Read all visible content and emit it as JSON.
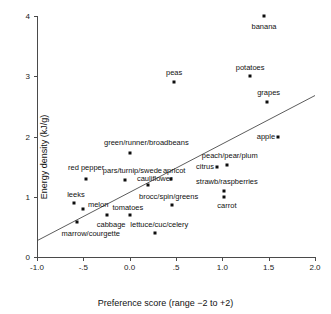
{
  "chart_data": {
    "type": "scatter",
    "title": "",
    "xlabel": "Preference score (range −2 to +2)",
    "ylabel": "Energy density (kJ/g)",
    "xlim": [
      -1.0,
      2.0
    ],
    "ylim": [
      0,
      4
    ],
    "xticks": [
      "-1.0",
      "-.5",
      "0.0",
      ".5",
      "1.0",
      "1.5",
      "2.0"
    ],
    "xtick_values": [
      -1.0,
      -0.5,
      0.0,
      0.5,
      1.0,
      1.5,
      2.0
    ],
    "yticks": [
      "0",
      "1",
      "2",
      "3",
      "4"
    ],
    "ytick_values": [
      0,
      1,
      2,
      3,
      4
    ],
    "grid": false,
    "legend": "none",
    "trendline": {
      "x0": -1.0,
      "y0": 0.27,
      "x1": 2.0,
      "y1": 2.68
    },
    "points": [
      {
        "label": "banana",
        "x": 1.45,
        "y": 4.0,
        "label_pos": "below",
        "lx": 1.45,
        "ly": 3.82
      },
      {
        "label": "peas",
        "x": 0.48,
        "y": 2.9,
        "label_pos": "above",
        "lx": 0.48,
        "ly": 3.06
      },
      {
        "label": "potatoes",
        "x": 1.3,
        "y": 3.0,
        "label_pos": "above",
        "lx": 1.3,
        "ly": 3.14
      },
      {
        "label": "grapes",
        "x": 1.48,
        "y": 2.58,
        "label_pos": "above",
        "lx": 1.5,
        "ly": 2.72
      },
      {
        "label": "apple",
        "x": 1.6,
        "y": 2.0,
        "label_pos": "left",
        "lx": 1.57,
        "ly": 2.0
      },
      {
        "label": "green/runner/broadbeans",
        "x": 0.0,
        "y": 1.73,
        "label_pos": "above",
        "lx": 0.18,
        "ly": 1.9
      },
      {
        "label": "peach/pear/plum",
        "x": 1.05,
        "y": 1.52,
        "label_pos": "above",
        "lx": 1.08,
        "ly": 1.68
      },
      {
        "label": "citrus",
        "x": 0.94,
        "y": 1.49,
        "label_pos": "left",
        "lx": 0.91,
        "ly": 1.49
      },
      {
        "label": "red pepper",
        "x": -0.47,
        "y": 1.3,
        "label_pos": "above",
        "lx": -0.47,
        "ly": 1.48
      },
      {
        "label": "pars/turnip/swede",
        "x": -0.05,
        "y": 1.27,
        "label_pos": "above",
        "lx": 0.03,
        "ly": 1.42
      },
      {
        "label": "apricot",
        "x": 0.45,
        "y": 1.3,
        "label_pos": "above",
        "lx": 0.48,
        "ly": 1.42
      },
      {
        "label": "cauliflower",
        "x": 0.2,
        "y": 1.2,
        "label_pos": "above",
        "lx": 0.27,
        "ly": 1.3
      },
      {
        "label": "strawb/raspberries",
        "x": 1.02,
        "y": 1.1,
        "label_pos": "above",
        "lx": 1.05,
        "ly": 1.24
      },
      {
        "label": "carrot",
        "x": 1.02,
        "y": 1.0,
        "label_pos": "below",
        "lx": 1.05,
        "ly": 0.84
      },
      {
        "label": "leeks",
        "x": -0.6,
        "y": 0.9,
        "label_pos": "above",
        "lx": -0.58,
        "ly": 1.03
      },
      {
        "label": "brocc/spin/greens",
        "x": 0.46,
        "y": 0.87,
        "label_pos": "above",
        "lx": 0.42,
        "ly": 1.0
      },
      {
        "label": "melon",
        "x": -0.5,
        "y": 0.8,
        "label_pos": "right",
        "lx": -0.45,
        "ly": 0.86
      },
      {
        "label": "tomatoes",
        "x": 0.0,
        "y": 0.69,
        "label_pos": "above",
        "lx": -0.02,
        "ly": 0.82
      },
      {
        "label": "cabbage",
        "x": -0.25,
        "y": 0.69,
        "label_pos": "below",
        "lx": -0.2,
        "ly": 0.53
      },
      {
        "label": "marrow/courgette",
        "x": -0.57,
        "y": 0.58,
        "label_pos": "below",
        "lx": -0.42,
        "ly": 0.38
      },
      {
        "label": "lettuce/cuc/celery",
        "x": 0.27,
        "y": 0.4,
        "label_pos": "above",
        "lx": 0.32,
        "ly": 0.53
      }
    ]
  },
  "style": {
    "marker_color": "#0d0d0d",
    "axis_color": "#4a4a4a",
    "text_color": "#111111",
    "background": "#ffffff"
  }
}
